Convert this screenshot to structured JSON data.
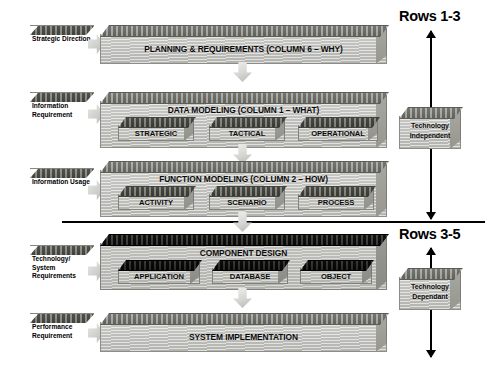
{
  "diagram": {
    "rows": [
      {
        "id": "planning",
        "label": "PLANNING & REQUIREMENTS (COLUMN 6 – WHY)",
        "input": "Strategic Direction",
        "style": "light",
        "subboxes": []
      },
      {
        "id": "data-modeling",
        "label": "DATA MODELING (COLUMN 1 – WHAT)",
        "input": "Information Requirement",
        "style": "light",
        "subboxes": [
          "STRATEGIC",
          "TACTICAL",
          "OPERATIONAL"
        ]
      },
      {
        "id": "function-modeling",
        "label": "FUNCTION MODELING (COLUMN 2 – HOW)",
        "input": "Information Usage",
        "style": "light",
        "subboxes": [
          "ACTIVITY",
          "SCENARIO",
          "PROCESS"
        ]
      },
      {
        "id": "component-design",
        "label": "COMPONENT DESIGN",
        "input": "Technology/ System Requirements",
        "style": "dark",
        "subboxes": [
          "APPLICATION",
          "DATABASE",
          "OBJECT"
        ]
      },
      {
        "id": "system-implementation",
        "label": "SYSTEM IMPLEMENTATION",
        "input": "Performance Requirement",
        "style": "light",
        "subboxes": []
      }
    ],
    "annotations": {
      "upper_rows": "Rows 1-3",
      "lower_rows": "Rows 3-5",
      "upper_tech": "Technology Independent",
      "lower_tech": "Technology Dependant"
    },
    "colors": {
      "slab_face": "#c4c4c0",
      "slab_top": "#76766f",
      "dark_top": "#111110",
      "line": "#000000",
      "background": "#ffffff"
    }
  }
}
